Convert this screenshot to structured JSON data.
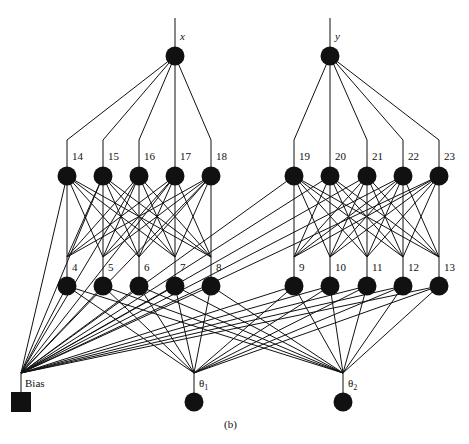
{
  "caption": "(b)",
  "colors": {
    "node": "#111111",
    "edge": "#111111",
    "background": "#ffffff"
  },
  "network": {
    "outputs": [
      {
        "id": "x",
        "label": "x",
        "cx": 175,
        "cy": 56,
        "top": 18
      },
      {
        "id": "y",
        "label": "y",
        "cx": 330,
        "cy": 56,
        "top": 18
      }
    ],
    "layer_upper": {
      "y": 176,
      "converge_top": 140,
      "nodes": [
        {
          "id": "14",
          "label": "14",
          "cx": 67,
          "parent": 0
        },
        {
          "id": "15",
          "label": "15",
          "cx": 103,
          "parent": 0
        },
        {
          "id": "16",
          "label": "16",
          "cx": 139,
          "parent": 0
        },
        {
          "id": "17",
          "label": "17",
          "cx": 175,
          "parent": 0
        },
        {
          "id": "18",
          "label": "18",
          "cx": 211,
          "parent": 0
        },
        {
          "id": "19",
          "label": "19",
          "cx": 294,
          "parent": 1
        },
        {
          "id": "20",
          "label": "20",
          "cx": 330,
          "parent": 1
        },
        {
          "id": "21",
          "label": "21",
          "cx": 367,
          "parent": 1
        },
        {
          "id": "22",
          "label": "22",
          "cx": 403,
          "parent": 1
        },
        {
          "id": "23",
          "label": "23",
          "cx": 439,
          "parent": 1
        }
      ]
    },
    "layer_lower": {
      "y": 286,
      "converge_top": 257,
      "nodes": [
        {
          "id": "4",
          "label": "4",
          "cx": 67,
          "group": 0
        },
        {
          "id": "5",
          "label": "5",
          "cx": 103,
          "group": 0
        },
        {
          "id": "6",
          "label": "6",
          "cx": 139,
          "group": 0
        },
        {
          "id": "7",
          "label": "7",
          "cx": 175,
          "group": 0
        },
        {
          "id": "8",
          "label": "8",
          "cx": 211,
          "group": 0
        },
        {
          "id": "9",
          "label": "9",
          "cx": 294,
          "group": 1
        },
        {
          "id": "10",
          "label": "10",
          "cx": 330,
          "group": 1
        },
        {
          "id": "11",
          "label": "11",
          "cx": 367,
          "group": 1
        },
        {
          "id": "12",
          "label": "12",
          "cx": 403,
          "group": 1
        },
        {
          "id": "13",
          "label": "13",
          "cx": 439,
          "group": 1
        }
      ]
    },
    "inputs": [
      {
        "id": "theta1",
        "label": "θ",
        "sub": "1",
        "cx": 194,
        "cy": 402,
        "converge": 373
      },
      {
        "id": "theta2",
        "label": "θ",
        "sub": "2",
        "cx": 343,
        "cy": 402,
        "converge": 373
      }
    ],
    "bias": {
      "label": "Bias",
      "x": 11,
      "y": 392,
      "size": 20,
      "converge_x": 21,
      "converge_y": 373
    },
    "node_radius": 9.5
  }
}
